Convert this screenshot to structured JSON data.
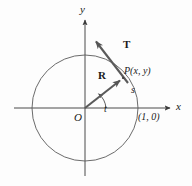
{
  "figure": {
    "background_color": "#fdfdfd",
    "stroke_color": "#4a4a4a",
    "vector_color": "#555555",
    "text_color": "#1a1a1a",
    "width": 192,
    "height": 186
  },
  "axes": {
    "x_label": "x",
    "y_label": "y",
    "origin_label": "O",
    "x_axis": {
      "x1": 14,
      "y1": 108,
      "x2": 172,
      "y2": 108
    },
    "y_axis": {
      "x1": 85,
      "y1": 176,
      "x2": 85,
      "y2": 18
    }
  },
  "circle": {
    "center_x": 85,
    "center_y": 108,
    "radius": 53,
    "description": "unit circle"
  },
  "angle": {
    "label": "t",
    "value_degrees": 53,
    "arc_radius": 18
  },
  "arc": {
    "label": "s",
    "description": "arc length from (1, 0) to P"
  },
  "vectors": [
    {
      "name": "R",
      "label": "R",
      "description": "position vector from origin to P",
      "x1": 85,
      "y1": 108,
      "x2": 123,
      "y2": 78
    },
    {
      "name": "T",
      "label": "T",
      "description": "tangent vector at P",
      "x1": 127,
      "y1": 82,
      "x2": 93,
      "y2": 38
    }
  ],
  "points": [
    {
      "name": "P",
      "label": "P(x,  y)",
      "x": 123,
      "y": 78,
      "on_circle": true
    },
    {
      "name": "unit-point",
      "label": "(1, 0)",
      "x": 138,
      "y": 108,
      "on_circle": true
    }
  ]
}
